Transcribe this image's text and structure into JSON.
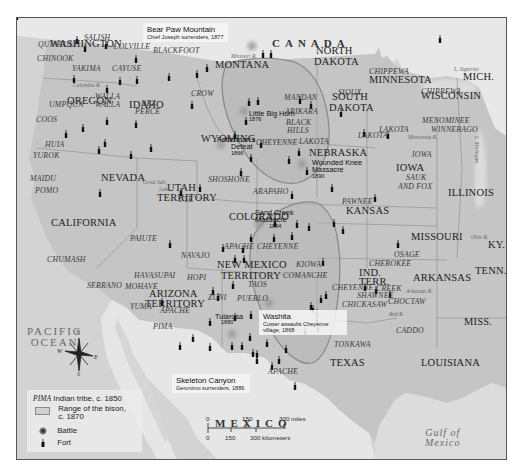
{
  "map": {
    "title_regions": {
      "country_north": "CANADA",
      "country_south": "MEXICO",
      "ocean_line1": "PACIFIC",
      "ocean_line2": "OCEAN",
      "gulf_line1": "Gulf of",
      "gulf_line2": "Mexico",
      "lake_superior": "L. Superior",
      "lake_michigan": "L. Michigan"
    },
    "states": [
      {
        "name": "WASHINGTON",
        "x": 49,
        "y": 43
      },
      {
        "name": "OREGON",
        "x": 66,
        "y": 100
      },
      {
        "name": "IDAHO",
        "x": 128,
        "y": 104
      },
      {
        "name": "MONTANA",
        "x": 214,
        "y": 64
      },
      {
        "name": "WYOMING",
        "x": 200,
        "y": 138
      },
      {
        "name": "NEVADA",
        "x": 100,
        "y": 177
      },
      {
        "name": "CALIFORNIA",
        "x": 50,
        "y": 222
      },
      {
        "name": "UTAH",
        "x": 166,
        "y": 187
      },
      {
        "name": "TERRITORY",
        "x": 156,
        "y": 197
      },
      {
        "name": "COLORADO",
        "x": 228,
        "y": 216
      },
      {
        "name": "NEW MEXICO",
        "x": 216,
        "y": 264
      },
      {
        "name": "TERRITORY",
        "x": 220,
        "y": 275
      },
      {
        "name": "ARIZONA",
        "x": 148,
        "y": 293
      },
      {
        "name": "TERRITORY",
        "x": 144,
        "y": 303
      },
      {
        "name": "NORTH",
        "x": 315,
        "y": 50
      },
      {
        "name": "DAKOTA",
        "x": 313,
        "y": 61
      },
      {
        "name": "SOUTH",
        "x": 331,
        "y": 96
      },
      {
        "name": "DAKOTA",
        "x": 328,
        "y": 107
      },
      {
        "name": "NEBRASKA",
        "x": 308,
        "y": 152
      },
      {
        "name": "KANSAS",
        "x": 345,
        "y": 210
      },
      {
        "name": "MINNESOTA",
        "x": 368,
        "y": 79
      },
      {
        "name": "WISCONSIN",
        "x": 420,
        "y": 95
      },
      {
        "name": "MICH.",
        "x": 462,
        "y": 76
      },
      {
        "name": "IOWA",
        "x": 395,
        "y": 167
      },
      {
        "name": "ILLINOIS",
        "x": 447,
        "y": 192
      },
      {
        "name": "MISSOURI",
        "x": 410,
        "y": 236
      },
      {
        "name": "KY.",
        "x": 487,
        "y": 244
      },
      {
        "name": "TENN.",
        "x": 474,
        "y": 270
      },
      {
        "name": "ARKANSAS",
        "x": 412,
        "y": 277
      },
      {
        "name": "IND.",
        "x": 358,
        "y": 272
      },
      {
        "name": "TERR.",
        "x": 358,
        "y": 281
      },
      {
        "name": "MISS.",
        "x": 463,
        "y": 321
      },
      {
        "name": "TEXAS",
        "x": 329,
        "y": 362
      },
      {
        "name": "LOUISIANA",
        "x": 420,
        "y": 362
      }
    ],
    "tribes": [
      {
        "name": "SALISH",
        "x": 83,
        "y": 38
      },
      {
        "name": "QUINAULT",
        "x": 37,
        "y": 45
      },
      {
        "name": "COLVILLE",
        "x": 112,
        "y": 47
      },
      {
        "name": "BLACKFOOT",
        "x": 152,
        "y": 51
      },
      {
        "name": "CHINOOK",
        "x": 36,
        "y": 59
      },
      {
        "name": "YAKIMA",
        "x": 71,
        "y": 69
      },
      {
        "name": "CAYUSE",
        "x": 111,
        "y": 69
      },
      {
        "name": "WALLA",
        "x": 94,
        "y": 97
      },
      {
        "name": "WALLA",
        "x": 94,
        "y": 105
      },
      {
        "name": "UMPQUA",
        "x": 48,
        "y": 105
      },
      {
        "name": "NEZ",
        "x": 140,
        "y": 104
      },
      {
        "name": "PERCE",
        "x": 134,
        "y": 112
      },
      {
        "name": "CROW",
        "x": 190,
        "y": 94
      },
      {
        "name": "COOS",
        "x": 35,
        "y": 120
      },
      {
        "name": "HUIA",
        "x": 44,
        "y": 145
      },
      {
        "name": "YUROK",
        "x": 32,
        "y": 156
      },
      {
        "name": "MAIDU",
        "x": 29,
        "y": 179
      },
      {
        "name": "POMO",
        "x": 34,
        "y": 191
      },
      {
        "name": "SHOSHONE",
        "x": 207,
        "y": 180
      },
      {
        "name": "UTE",
        "x": 177,
        "y": 200
      },
      {
        "name": "PAIUTE",
        "x": 129,
        "y": 239
      },
      {
        "name": "CHUMASH",
        "x": 46,
        "y": 260
      },
      {
        "name": "NAVAJO",
        "x": 180,
        "y": 256
      },
      {
        "name": "APACHE",
        "x": 223,
        "y": 247
      },
      {
        "name": "CHEYENNE",
        "x": 256,
        "y": 247
      },
      {
        "name": "HAVASUPAI",
        "x": 133,
        "y": 276
      },
      {
        "name": "HOPI",
        "x": 186,
        "y": 278
      },
      {
        "name": "SERRANO",
        "x": 86,
        "y": 286
      },
      {
        "name": "MOHAVE",
        "x": 124,
        "y": 287
      },
      {
        "name": "ZUNI",
        "x": 207,
        "y": 298
      },
      {
        "name": "PUEBLO",
        "x": 236,
        "y": 299
      },
      {
        "name": "TAOS",
        "x": 247,
        "y": 285
      },
      {
        "name": "YUMA",
        "x": 129,
        "y": 307
      },
      {
        "name": "APACHE",
        "x": 159,
        "y": 311
      },
      {
        "name": "PIMA",
        "x": 152,
        "y": 327
      },
      {
        "name": "MANDAN",
        "x": 283,
        "y": 98
      },
      {
        "name": "ARIKARA",
        "x": 284,
        "y": 112
      },
      {
        "name": "BLACK",
        "x": 285,
        "y": 123
      },
      {
        "name": "HILLS",
        "x": 286,
        "y": 131
      },
      {
        "name": "LAKOTA",
        "x": 298,
        "y": 142
      },
      {
        "name": "CHEYENNE",
        "x": 255,
        "y": 143
      },
      {
        "name": "SIOUX",
        "x": 337,
        "y": 93
      },
      {
        "name": "LAKOTA",
        "x": 357,
        "y": 136
      },
      {
        "name": "CHIPPEWA",
        "x": 368,
        "y": 72
      },
      {
        "name": "CHIPPEWA",
        "x": 420,
        "y": 92
      },
      {
        "name": "MENOMINEE",
        "x": 421,
        "y": 121
      },
      {
        "name": "WINNEBAGO",
        "x": 430,
        "y": 130
      },
      {
        "name": "LAKOTA",
        "x": 378,
        "y": 130
      },
      {
        "name": "IOWA",
        "x": 411,
        "y": 155
      },
      {
        "name": "SAUK",
        "x": 405,
        "y": 178
      },
      {
        "name": "AND FOX",
        "x": 397,
        "y": 187
      },
      {
        "name": "ARAPAHO",
        "x": 252,
        "y": 192
      },
      {
        "name": "PAWNEE",
        "x": 341,
        "y": 202
      },
      {
        "name": "KIOWA",
        "x": 295,
        "y": 265
      },
      {
        "name": "COMANCHE",
        "x": 282,
        "y": 276
      },
      {
        "name": "OSAGE",
        "x": 393,
        "y": 255
      },
      {
        "name": "CHEROKEE",
        "x": 368,
        "y": 264
      },
      {
        "name": "CHEYENNE",
        "x": 331,
        "y": 288
      },
      {
        "name": "CREEK",
        "x": 375,
        "y": 289
      },
      {
        "name": "SHAWNEE",
        "x": 356,
        "y": 296
      },
      {
        "name": "CHOCTAW",
        "x": 387,
        "y": 302
      },
      {
        "name": "CHICKASAW",
        "x": 341,
        "y": 305
      },
      {
        "name": "CADDO",
        "x": 395,
        "y": 331
      },
      {
        "name": "TONKAWA",
        "x": 333,
        "y": 345
      },
      {
        "name": "APACHE",
        "x": 267,
        "y": 372
      }
    ],
    "rivers": [
      {
        "name": "Columbia R.",
        "x": 72,
        "y": 87
      },
      {
        "name": "Missouri R.",
        "x": 230,
        "y": 58
      },
      {
        "name": "Great Salt",
        "x": 142,
        "y": 184
      },
      {
        "name": "Lake",
        "x": 158,
        "y": 191
      },
      {
        "name": "Minnesota R.",
        "x": 407,
        "y": 139
      },
      {
        "name": "Ohio R.",
        "x": 470,
        "y": 239
      },
      {
        "name": "Red R.",
        "x": 388,
        "y": 316
      },
      {
        "name": "Arkansas R.",
        "x": 405,
        "y": 293
      }
    ],
    "events": [
      {
        "id": "bear-paw",
        "title": "Bear Paw Mountain",
        "subtitle": "Chief Joseph surrenders, 1877",
        "x": 142,
        "y": 28,
        "callout": true
      },
      {
        "id": "little-big-horn",
        "title": "Little Big Horn",
        "subtitle": "1876",
        "x": 248,
        "y": 104,
        "callout": false
      },
      {
        "id": "fetterman",
        "title": "Fetterman's",
        "subtitle_line": "Defeat",
        "subtitle": "1866",
        "x": 216,
        "y": 130,
        "callout": false
      },
      {
        "id": "wounded-knee",
        "title": "Wounded Knee",
        "subtitle_line": "Massacre",
        "subtitle": "1890",
        "x": 311,
        "y": 160,
        "callout": false
      },
      {
        "id": "sand-creek",
        "title": "Sand Creek",
        "subtitle_line": "Massacre",
        "subtitle": "1864",
        "x": 255,
        "y": 207,
        "callout": false
      },
      {
        "id": "washita",
        "title": "Washita",
        "subtitle": "Custer assaults Cheyenne village, 1868",
        "x": 258,
        "y": 309,
        "callout": true
      },
      {
        "id": "tularosa",
        "title": "Tularosa",
        "subtitle": "1880",
        "x": 215,
        "y": 307,
        "callout": false
      },
      {
        "id": "skeleton-canyon",
        "title": "Skeleton Canyon",
        "subtitle": "Geronimo surrenders, 1886",
        "x": 170,
        "y": 364,
        "callout": true
      }
    ],
    "compass": {
      "n": "N",
      "s": "S",
      "e": "E",
      "w": "W"
    },
    "legend": {
      "tribe_example": "PIMA",
      "tribe_label": "Indian tribe, c. 1850",
      "bison_label_line1": "Range of the bison,",
      "bison_label_line2": "c. 1870",
      "battle_label": "Battle",
      "fort_label": "Fort"
    },
    "scale": {
      "miles_ticks": [
        "0",
        "150",
        "300 miles"
      ],
      "km_ticks": [
        "0",
        "150",
        "300 kilometers"
      ]
    },
    "colors": {
      "us_land": "#c4c4c4",
      "foreign_land": "#e4e4e4",
      "water": "#d2d2d2",
      "bison_range": "#b0b0b0",
      "border": "#555555"
    }
  }
}
